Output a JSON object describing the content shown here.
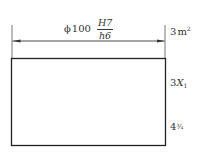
{
  "drawing": {
    "dimension": {
      "diameter_symbol": "ϕ",
      "nominal_size": "100",
      "hole_tolerance": "H7",
      "shaft_tolerance": "h6"
    },
    "side_labels": {
      "area": {
        "value": "3",
        "unit": "m",
        "exponent": "2"
      },
      "term": {
        "coefficient": "3",
        "variable": "X",
        "subscript": "1"
      },
      "mixed_number": {
        "whole": "4",
        "fraction": "¾"
      }
    },
    "colors": {
      "line": "#333333",
      "background": "#ffffff"
    }
  }
}
